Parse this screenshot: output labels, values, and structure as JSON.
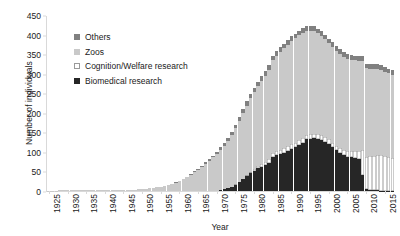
{
  "chart_data": {
    "type": "bar",
    "stacked": true,
    "title": "",
    "xlabel": "Year",
    "ylabel": "Number of individuals",
    "ylim": [
      0,
      450
    ],
    "ytick_step": 50,
    "yticks": [
      0,
      50,
      100,
      150,
      200,
      250,
      300,
      350,
      400,
      450
    ],
    "xlim": [
      1925,
      2017
    ],
    "xtick_step": 5,
    "xticks": [
      1925,
      1930,
      1935,
      1940,
      1945,
      1950,
      1955,
      1960,
      1965,
      1970,
      1975,
      1980,
      1985,
      1990,
      1995,
      2000,
      2005,
      2010,
      2015
    ],
    "grid": false,
    "legend_position": "upper-left-inside",
    "colors": {
      "others": "#808080",
      "zoos": "#c9c9c9",
      "cognition_welfare": "#ffffff",
      "biomedical": "#262626",
      "axis": "#d9d9d9",
      "text": "#1a1a1a",
      "background": "#ffffff"
    },
    "legend": [
      {
        "key": "others",
        "label": "Others",
        "color": "#808080"
      },
      {
        "key": "zoos",
        "label": "Zoos",
        "color": "#c9c9c9"
      },
      {
        "key": "cognition_welfare",
        "label": "Cognition/Welfare research",
        "color": "#ffffff"
      },
      {
        "key": "biomedical",
        "label": "Biomedical research",
        "color": "#262626"
      }
    ],
    "stack_order_bottom_to_top": [
      "biomedical",
      "cognition_welfare",
      "zoos",
      "others"
    ],
    "x": [
      1925,
      1926,
      1927,
      1928,
      1929,
      1930,
      1931,
      1932,
      1933,
      1934,
      1935,
      1936,
      1937,
      1938,
      1939,
      1940,
      1941,
      1942,
      1943,
      1944,
      1945,
      1946,
      1947,
      1948,
      1949,
      1950,
      1951,
      1952,
      1953,
      1954,
      1955,
      1956,
      1957,
      1958,
      1959,
      1960,
      1961,
      1962,
      1963,
      1964,
      1965,
      1966,
      1967,
      1968,
      1969,
      1970,
      1971,
      1972,
      1973,
      1974,
      1975,
      1976,
      1977,
      1978,
      1979,
      1980,
      1981,
      1982,
      1983,
      1984,
      1985,
      1986,
      1987,
      1988,
      1989,
      1990,
      1991,
      1992,
      1993,
      1994,
      1995,
      1996,
      1997,
      1998,
      1999,
      2000,
      2001,
      2002,
      2003,
      2004,
      2005,
      2006,
      2007,
      2008,
      2009,
      2010,
      2011,
      2012,
      2013,
      2014,
      2015,
      2016,
      2017
    ],
    "series": [
      {
        "name": "Biomedical research",
        "key": "biomedical",
        "color": "#262626",
        "values": [
          0,
          0,
          0,
          0,
          0,
          0,
          0,
          0,
          0,
          0,
          0,
          0,
          0,
          0,
          0,
          0,
          0,
          0,
          0,
          0,
          0,
          0,
          0,
          0,
          0,
          0,
          0,
          0,
          0,
          0,
          0,
          0,
          0,
          0,
          0,
          0,
          0,
          0,
          0,
          0,
          0,
          0,
          0,
          0,
          0,
          0,
          2,
          4,
          7,
          11,
          16,
          22,
          30,
          38,
          46,
          52,
          58,
          62,
          66,
          72,
          88,
          92,
          95,
          98,
          102,
          108,
          112,
          118,
          124,
          132,
          134,
          135,
          133,
          130,
          126,
          120,
          112,
          104,
          98,
          92,
          88,
          86,
          84,
          82,
          40,
          6,
          3,
          2,
          2,
          1,
          1,
          1,
          1
        ]
      },
      {
        "name": "Cognition/Welfare research",
        "key": "cognition_welfare",
        "color": "#ffffff",
        "values": [
          0,
          0,
          0,
          0,
          0,
          0,
          0,
          0,
          0,
          0,
          0,
          0,
          0,
          0,
          0,
          0,
          0,
          0,
          0,
          0,
          0,
          0,
          0,
          0,
          0,
          0,
          0,
          0,
          0,
          0,
          0,
          0,
          0,
          0,
          0,
          0,
          0,
          0,
          0,
          0,
          0,
          0,
          0,
          0,
          0,
          0,
          0,
          0,
          0,
          0,
          1,
          1,
          2,
          2,
          3,
          4,
          6,
          7,
          8,
          9,
          10,
          10,
          11,
          11,
          12,
          12,
          12,
          12,
          12,
          12,
          12,
          12,
          12,
          12,
          12,
          12,
          12,
          12,
          12,
          13,
          14,
          16,
          18,
          20,
          64,
          82,
          86,
          88,
          90,
          90,
          88,
          86,
          84
        ]
      },
      {
        "name": "Zoos",
        "key": "zoos",
        "color": "#c9c9c9",
        "values": [
          1,
          1,
          1,
          2,
          2,
          2,
          2,
          3,
          3,
          3,
          3,
          3,
          3,
          3,
          3,
          3,
          3,
          2,
          2,
          2,
          2,
          2,
          3,
          3,
          4,
          5,
          6,
          7,
          8,
          9,
          11,
          13,
          15,
          18,
          21,
          25,
          30,
          36,
          42,
          48,
          55,
          62,
          70,
          78,
          86,
          95,
          104,
          112,
          122,
          132,
          144,
          156,
          168,
          178,
          188,
          196,
          204,
          212,
          220,
          228,
          236,
          244,
          250,
          256,
          260,
          264,
          266,
          268,
          268,
          266,
          264,
          262,
          258,
          254,
          250,
          246,
          244,
          242,
          240,
          238,
          236,
          234,
          232,
          230,
          228,
          226,
          224,
          222,
          220,
          218,
          216,
          214,
          212
        ]
      },
      {
        "name": "Others",
        "key": "others",
        "color": "#808080",
        "values": [
          0,
          0,
          0,
          0,
          0,
          0,
          0,
          0,
          0,
          0,
          0,
          0,
          0,
          0,
          0,
          0,
          0,
          0,
          0,
          0,
          0,
          0,
          0,
          0,
          0,
          0,
          0,
          0,
          0,
          0,
          0,
          0,
          0,
          0,
          1,
          1,
          1,
          1,
          2,
          2,
          2,
          3,
          3,
          4,
          4,
          5,
          6,
          6,
          7,
          8,
          9,
          10,
          10,
          11,
          11,
          12,
          12,
          12,
          12,
          12,
          12,
          12,
          12,
          12,
          12,
          12,
          12,
          12,
          12,
          12,
          12,
          12,
          12,
          12,
          12,
          12,
          12,
          12,
          12,
          12,
          12,
          12,
          12,
          12,
          12,
          12,
          12,
          12,
          12,
          12,
          12,
          12,
          12
        ]
      }
    ]
  }
}
